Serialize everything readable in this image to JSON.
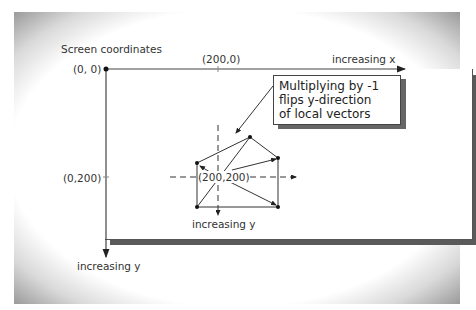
{
  "title": "Screen coordinates",
  "labels": {
    "origin": "(0, 0)",
    "x200": "(200,0)",
    "y200": "(0,200)",
    "center": "(200,200)",
    "increasing_x": "increasing x",
    "increasing_y_outer": "increasing y",
    "increasing_y_local": "increasing y"
  },
  "callout": {
    "line1": "Multiplying by -1",
    "line2": "flips y-direction",
    "line3": "of local vectors"
  }
}
